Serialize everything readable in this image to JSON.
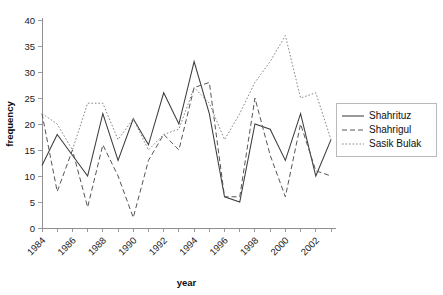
{
  "chart_data": {
    "type": "line",
    "title": "",
    "xlabel": "year",
    "ylabel": "frequency",
    "xlim": [
      1984,
      2003
    ],
    "ylim": [
      0,
      40
    ],
    "ytick_step": 5,
    "yticks": [
      0,
      5,
      10,
      15,
      20,
      25,
      30,
      35,
      40
    ],
    "grid": false,
    "legend_position": "right",
    "x": [
      1984,
      1985,
      1986,
      1987,
      1988,
      1989,
      1990,
      1991,
      1992,
      1993,
      1994,
      1995,
      1996,
      1997,
      1998,
      1999,
      2000,
      2001,
      2002,
      2003
    ],
    "xtick_labels": [
      "1984",
      "",
      "1986",
      "",
      "1988",
      "",
      "1990",
      "",
      "1992",
      "",
      "1994",
      "",
      "1996",
      "",
      "1998",
      "",
      "2000",
      "",
      "2002",
      ""
    ],
    "xticks_all": [
      1984,
      1985,
      1986,
      1987,
      1988,
      1989,
      1990,
      1991,
      1992,
      1993,
      1994,
      1995,
      1996,
      1997,
      1998,
      1999,
      2000,
      2001,
      2002,
      2003
    ],
    "series": [
      {
        "name": "Shahrituz",
        "style": "solid",
        "color": "#3c3c3c",
        "values": [
          12,
          18,
          14,
          10,
          22,
          13,
          21,
          16,
          26,
          20,
          32,
          22,
          6,
          5,
          20,
          19,
          13,
          22,
          10,
          17
        ]
      },
      {
        "name": "Shahrigul",
        "style": "dashed",
        "color": "#555555",
        "values": [
          22,
          7,
          15,
          4,
          16,
          10,
          2,
          13,
          18,
          15,
          27,
          28,
          6,
          6,
          25,
          14,
          6,
          20,
          11,
          10
        ]
      },
      {
        "name": "Sasik Bulak",
        "style": "dotted",
        "color": "#868686",
        "values": [
          22,
          20,
          15,
          24,
          24,
          17,
          21,
          15,
          18,
          19,
          27,
          24,
          17,
          22,
          28,
          32,
          37,
          25,
          26,
          17
        ]
      }
    ]
  },
  "legend": {
    "items": [
      {
        "label": "Shahrituz"
      },
      {
        "label": "Shahrigul"
      },
      {
        "label": "Sasik Bulak"
      }
    ]
  },
  "axes": {
    "x_title": "year",
    "y_title": "frequency"
  }
}
